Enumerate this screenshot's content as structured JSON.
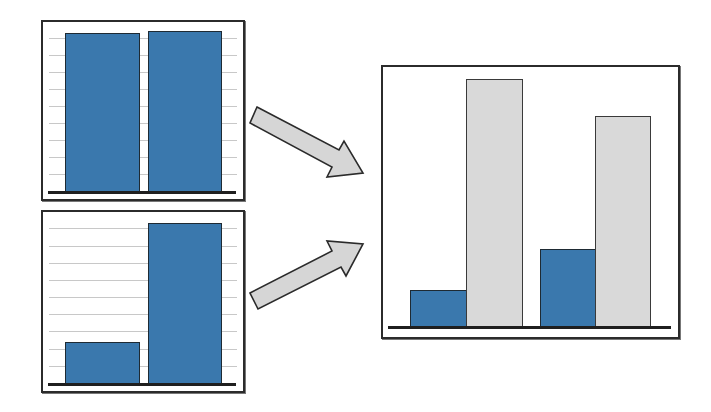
{
  "diagram": {
    "colors": {
      "primary_bar": "#3a78ad",
      "secondary_bar": "#d9d9d9",
      "border": "#2b2b2b",
      "arrow_fill": "#d6d6d6",
      "gridline": "#c8c8c8"
    },
    "panels": [
      {
        "id": "top-left",
        "box": {
          "x": 41,
          "y": 20,
          "w": 204,
          "h": 181
        },
        "baseline_y": 191,
        "gridlines_y": [
          38,
          55,
          72,
          89,
          106,
          123,
          140,
          157,
          174
        ],
        "bars": [
          {
            "x": 65,
            "w": 75,
            "top": 33,
            "color": "primary_bar"
          },
          {
            "x": 148,
            "w": 74,
            "top": 31,
            "color": "primary_bar"
          }
        ]
      },
      {
        "id": "bottom-left",
        "box": {
          "x": 41,
          "y": 210,
          "w": 204,
          "h": 183
        },
        "baseline_y": 383,
        "gridlines_y": [
          228,
          246,
          263,
          280,
          297,
          314,
          331,
          349,
          366
        ],
        "bars": [
          {
            "x": 65,
            "w": 75,
            "top": 342,
            "color": "primary_bar"
          },
          {
            "x": 148,
            "w": 74,
            "top": 223,
            "color": "primary_bar"
          }
        ]
      },
      {
        "id": "right-combined",
        "box": {
          "x": 381,
          "y": 65,
          "w": 299,
          "h": 274
        },
        "baseline_y": 326,
        "gridlines_y": [],
        "bars": [
          {
            "x": 410,
            "w": 57,
            "top": 290,
            "color": "primary_bar"
          },
          {
            "x": 466,
            "w": 57,
            "top": 79,
            "color": "secondary_bar"
          },
          {
            "x": 540,
            "w": 56,
            "top": 249,
            "color": "primary_bar"
          },
          {
            "x": 595,
            "w": 56,
            "top": 116,
            "color": "secondary_bar"
          }
        ]
      }
    ],
    "arrows": [
      {
        "id": "arrow-top",
        "direction": "down-right",
        "from": [
          255,
          115
        ],
        "to": [
          363,
          170
        ]
      },
      {
        "id": "arrow-bottom",
        "direction": "up-right",
        "from": [
          255,
          300
        ],
        "to": [
          363,
          250
        ]
      }
    ]
  }
}
